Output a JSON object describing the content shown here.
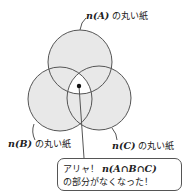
{
  "labels": {
    "a": {
      "math": "n(A)",
      "text": " の丸い紙"
    },
    "b": {
      "math": "n(B)",
      "text": " の丸い紙"
    },
    "c": {
      "math": "n(C)",
      "text": " の丸い紙"
    }
  },
  "callout": {
    "line1_text": "アリャ！ ",
    "line1_math": "n(A∩B∩C)",
    "line2_text": "の部分がなくなった！"
  },
  "colors": {
    "fill": "#e8e8e8",
    "stroke": "#555555",
    "hole": "#ffffff"
  }
}
